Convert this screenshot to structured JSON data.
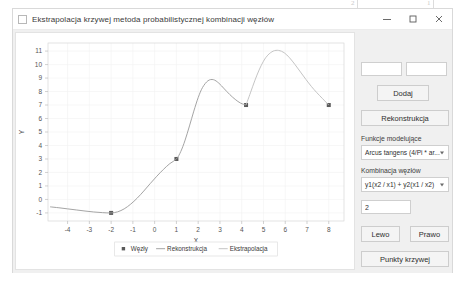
{
  "page_annotations": {
    "marks": [
      {
        "label": "2",
        "x": 357
      },
      {
        "label": "1",
        "x": 433
      }
    ]
  },
  "window": {
    "title": "Ekstrapolacja krzywej metoda probabilistycznej kombinacji węzłów",
    "system_icon": "app-icon",
    "controls": {
      "minimize": "minimize-icon",
      "maximize": "maximize-icon",
      "close": "close-icon"
    }
  },
  "controls_panel": {
    "input_x": {
      "value": "",
      "placeholder": ""
    },
    "input_y": {
      "value": "",
      "placeholder": ""
    },
    "add_button": "Dodaj",
    "reconstruct_button": "Rekonstrukcja",
    "model_functions_label": "Funkcje modelujące",
    "model_functions_value": "Arcus tangens (4/Pi * ar...",
    "node_combination_label": "Kombinacja węzłów",
    "node_combination_value": "y1(x2 / x1) + y2(x1 / x2)",
    "combination_param": "2",
    "left_button": "Lewo",
    "right_button": "Prawo",
    "curve_points_button": "Punkty krzywej"
  },
  "chart_data": {
    "type": "line",
    "title": "",
    "xlabel": "X",
    "ylabel": "Y",
    "xlim": [
      -4.9,
      8.7
    ],
    "ylim": [
      -1.6,
      11.6
    ],
    "xticks": [
      -4,
      -3,
      -2,
      -1,
      0,
      1,
      2,
      3,
      4,
      5,
      6,
      7,
      8
    ],
    "yticks": [
      -1,
      0,
      1,
      2,
      3,
      4,
      5,
      6,
      7,
      8,
      9,
      10,
      11
    ],
    "grid": true,
    "legend_position": "bottom",
    "legend": [
      {
        "name": "Węzły",
        "marker": "square",
        "color": "#5a5a5a"
      },
      {
        "name": "Rekonstrukcja",
        "marker": "line",
        "color": "#9a9a9a"
      },
      {
        "name": "Ekstrapolacja",
        "marker": "line",
        "color": "#bdbdbd"
      }
    ],
    "series": [
      {
        "name": "Węzły",
        "type": "scatter",
        "color": "#5a5a5a",
        "points": [
          {
            "x": -2.0,
            "y": -1.0
          },
          {
            "x": 1.0,
            "y": 3.0
          },
          {
            "x": 4.2,
            "y": 7.0
          },
          {
            "x": 8.0,
            "y": 7.0
          }
        ]
      },
      {
        "name": "Rekonstrukcja",
        "type": "line",
        "color": "#9a9a9a",
        "points": [
          {
            "x": -4.8,
            "y": -0.55
          },
          {
            "x": -4.4,
            "y": -0.62
          },
          {
            "x": -4.0,
            "y": -0.7
          },
          {
            "x": -3.6,
            "y": -0.78
          },
          {
            "x": -3.2,
            "y": -0.86
          },
          {
            "x": -2.8,
            "y": -0.93
          },
          {
            "x": -2.4,
            "y": -0.98
          },
          {
            "x": -2.0,
            "y": -1.0
          },
          {
            "x": -1.7,
            "y": -0.92
          },
          {
            "x": -1.4,
            "y": -0.7
          },
          {
            "x": -1.1,
            "y": -0.35
          },
          {
            "x": -0.8,
            "y": 0.1
          },
          {
            "x": -0.5,
            "y": 0.62
          },
          {
            "x": -0.2,
            "y": 1.18
          },
          {
            "x": 0.1,
            "y": 1.72
          },
          {
            "x": 0.4,
            "y": 2.22
          },
          {
            "x": 0.7,
            "y": 2.66
          },
          {
            "x": 1.0,
            "y": 3.0
          },
          {
            "x": 1.2,
            "y": 3.55
          },
          {
            "x": 1.4,
            "y": 4.4
          },
          {
            "x": 1.6,
            "y": 5.45
          },
          {
            "x": 1.8,
            "y": 6.55
          },
          {
            "x": 2.0,
            "y": 7.55
          },
          {
            "x": 2.2,
            "y": 8.3
          },
          {
            "x": 2.45,
            "y": 8.8
          },
          {
            "x": 2.7,
            "y": 8.88
          },
          {
            "x": 2.95,
            "y": 8.62
          },
          {
            "x": 3.2,
            "y": 8.2
          },
          {
            "x": 3.45,
            "y": 7.78
          },
          {
            "x": 3.7,
            "y": 7.42
          },
          {
            "x": 3.95,
            "y": 7.14
          },
          {
            "x": 4.2,
            "y": 7.0
          }
        ]
      },
      {
        "name": "Ekstrapolacja",
        "type": "line",
        "color": "#bdbdbd",
        "points": [
          {
            "x": 4.2,
            "y": 7.0
          },
          {
            "x": 4.4,
            "y": 7.9
          },
          {
            "x": 4.6,
            "y": 8.8
          },
          {
            "x": 4.8,
            "y": 9.6
          },
          {
            "x": 5.0,
            "y": 10.25
          },
          {
            "x": 5.2,
            "y": 10.7
          },
          {
            "x": 5.45,
            "y": 11.0
          },
          {
            "x": 5.7,
            "y": 11.05
          },
          {
            "x": 5.95,
            "y": 10.88
          },
          {
            "x": 6.2,
            "y": 10.5
          },
          {
            "x": 6.45,
            "y": 10.0
          },
          {
            "x": 6.7,
            "y": 9.45
          },
          {
            "x": 6.95,
            "y": 8.9
          },
          {
            "x": 7.2,
            "y": 8.38
          },
          {
            "x": 7.45,
            "y": 7.92
          },
          {
            "x": 7.7,
            "y": 7.5
          },
          {
            "x": 8.0,
            "y": 7.0
          }
        ]
      }
    ]
  }
}
